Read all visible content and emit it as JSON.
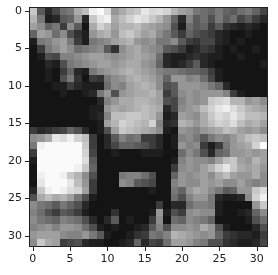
{
  "chart_data": {
    "type": "heatmap",
    "title": "",
    "xlabel": "",
    "ylabel": "",
    "colormap": "gray",
    "x_ticks": [
      0,
      5,
      10,
      15,
      20,
      25,
      30
    ],
    "y_ticks": [
      0,
      5,
      10,
      15,
      20,
      25,
      30
    ],
    "xlim": [
      -0.5,
      31.5
    ],
    "ylim": [
      31.5,
      -0.5
    ],
    "grid": false,
    "shape": [
      32,
      32
    ],
    "values": [
      [
        200,
        90,
        40,
        70,
        110,
        120,
        170,
        190,
        240,
        250,
        220,
        150,
        170,
        190,
        200,
        230,
        215,
        220,
        210,
        180,
        160,
        150,
        120,
        110,
        100,
        120,
        100,
        90,
        110,
        120,
        100,
        70
      ],
      [
        180,
        120,
        30,
        40,
        90,
        100,
        150,
        40,
        200,
        230,
        240,
        170,
        190,
        210,
        230,
        220,
        200,
        180,
        150,
        100,
        40,
        130,
        90,
        110,
        80,
        120,
        90,
        110,
        70,
        90,
        60,
        40
      ],
      [
        160,
        140,
        100,
        120,
        60,
        140,
        90,
        20,
        170,
        210,
        190,
        160,
        180,
        180,
        190,
        170,
        160,
        150,
        140,
        80,
        30,
        110,
        90,
        100,
        60,
        90,
        50,
        40,
        30,
        40,
        30,
        20
      ],
      [
        100,
        160,
        150,
        110,
        140,
        80,
        50,
        30,
        150,
        170,
        180,
        150,
        190,
        200,
        180,
        160,
        170,
        140,
        120,
        90,
        60,
        100,
        80,
        70,
        60,
        40,
        30,
        20,
        20,
        30,
        20,
        20
      ],
      [
        30,
        120,
        130,
        150,
        160,
        120,
        60,
        30,
        120,
        130,
        140,
        160,
        170,
        180,
        150,
        140,
        150,
        120,
        120,
        140,
        90,
        60,
        50,
        70,
        70,
        40,
        30,
        20,
        30,
        20,
        20,
        20
      ],
      [
        20,
        60,
        120,
        140,
        160,
        140,
        110,
        120,
        130,
        140,
        90,
        50,
        140,
        160,
        170,
        150,
        140,
        130,
        90,
        80,
        60,
        30,
        40,
        60,
        50,
        30,
        20,
        30,
        20,
        20,
        30,
        20
      ],
      [
        20,
        30,
        80,
        70,
        130,
        130,
        140,
        150,
        160,
        160,
        150,
        140,
        150,
        160,
        170,
        160,
        150,
        110,
        40,
        30,
        30,
        40,
        50,
        40,
        30,
        30,
        20,
        20,
        30,
        20,
        20,
        20
      ],
      [
        20,
        20,
        40,
        30,
        80,
        120,
        130,
        140,
        150,
        160,
        160,
        150,
        160,
        170,
        170,
        150,
        140,
        100,
        40,
        30,
        40,
        60,
        90,
        40,
        30,
        20,
        20,
        20,
        20,
        20,
        20,
        30
      ],
      [
        20,
        20,
        30,
        20,
        60,
        100,
        40,
        30,
        120,
        140,
        150,
        160,
        170,
        180,
        170,
        160,
        150,
        130,
        120,
        120,
        110,
        100,
        100,
        90,
        60,
        30,
        20,
        20,
        20,
        20,
        20,
        20
      ],
      [
        20,
        20,
        30,
        20,
        80,
        120,
        50,
        20,
        60,
        50,
        120,
        140,
        150,
        170,
        180,
        170,
        160,
        140,
        100,
        150,
        150,
        130,
        140,
        110,
        70,
        30,
        20,
        20,
        20,
        20,
        20,
        20
      ],
      [
        20,
        20,
        20,
        30,
        30,
        60,
        40,
        30,
        30,
        30,
        110,
        140,
        130,
        160,
        170,
        180,
        170,
        140,
        80,
        90,
        150,
        150,
        150,
        140,
        120,
        100,
        40,
        20,
        20,
        20,
        20,
        20
      ],
      [
        20,
        20,
        20,
        20,
        30,
        20,
        20,
        30,
        40,
        120,
        150,
        80,
        150,
        160,
        170,
        170,
        180,
        160,
        60,
        90,
        140,
        150,
        140,
        150,
        150,
        150,
        130,
        60,
        30,
        20,
        20,
        20
      ],
      [
        20,
        20,
        20,
        20,
        20,
        20,
        20,
        20,
        20,
        40,
        130,
        150,
        170,
        170,
        180,
        180,
        170,
        160,
        80,
        70,
        130,
        150,
        140,
        150,
        200,
        210,
        220,
        180,
        180,
        150,
        160,
        140
      ],
      [
        20,
        20,
        20,
        20,
        20,
        20,
        20,
        20,
        30,
        30,
        150,
        170,
        160,
        170,
        180,
        190,
        180,
        170,
        40,
        70,
        140,
        150,
        160,
        190,
        210,
        230,
        240,
        220,
        200,
        180,
        170,
        160
      ],
      [
        20,
        20,
        20,
        20,
        20,
        20,
        20,
        20,
        30,
        40,
        130,
        190,
        190,
        200,
        200,
        190,
        180,
        150,
        30,
        40,
        160,
        150,
        140,
        170,
        200,
        220,
        210,
        230,
        210,
        190,
        190,
        180
      ],
      [
        20,
        20,
        20,
        20,
        20,
        20,
        20,
        20,
        20,
        30,
        160,
        180,
        210,
        200,
        190,
        180,
        210,
        130,
        40,
        50,
        180,
        170,
        150,
        170,
        190,
        210,
        200,
        220,
        190,
        170,
        180,
        160
      ],
      [
        60,
        40,
        50,
        60,
        70,
        100,
        80,
        40,
        20,
        30,
        80,
        160,
        200,
        190,
        180,
        170,
        160,
        140,
        30,
        20,
        150,
        140,
        130,
        150,
        160,
        170,
        190,
        180,
        160,
        150,
        160,
        140
      ],
      [
        140,
        150,
        170,
        230,
        220,
        240,
        210,
        190,
        60,
        20,
        40,
        90,
        130,
        110,
        120,
        60,
        60,
        40,
        20,
        30,
        130,
        140,
        120,
        90,
        120,
        140,
        130,
        150,
        170,
        190,
        200,
        190
      ],
      [
        120,
        240,
        250,
        250,
        250,
        250,
        250,
        200,
        60,
        20,
        40,
        70,
        100,
        100,
        90,
        80,
        60,
        40,
        20,
        30,
        150,
        130,
        140,
        60,
        30,
        60,
        120,
        150,
        160,
        170,
        210,
        250
      ],
      [
        60,
        250,
        250,
        250,
        250,
        250,
        250,
        210,
        70,
        20,
        20,
        30,
        20,
        20,
        20,
        30,
        30,
        30,
        20,
        20,
        110,
        140,
        120,
        80,
        40,
        100,
        110,
        150,
        150,
        160,
        150,
        160
      ],
      [
        30,
        250,
        250,
        250,
        250,
        250,
        250,
        220,
        90,
        20,
        20,
        20,
        20,
        20,
        20,
        20,
        20,
        20,
        20,
        30,
        130,
        150,
        140,
        140,
        130,
        160,
        190,
        200,
        160,
        150,
        180,
        160
      ],
      [
        20,
        250,
        250,
        250,
        250,
        250,
        240,
        200,
        100,
        20,
        20,
        20,
        20,
        20,
        20,
        20,
        20,
        20,
        20,
        60,
        140,
        150,
        140,
        160,
        180,
        210,
        230,
        200,
        170,
        160,
        170,
        150
      ],
      [
        20,
        240,
        250,
        250,
        240,
        200,
        180,
        140,
        80,
        20,
        20,
        20,
        120,
        130,
        130,
        110,
        80,
        20,
        20,
        100,
        150,
        140,
        150,
        160,
        140,
        170,
        190,
        160,
        150,
        150,
        170,
        140
      ],
      [
        20,
        230,
        250,
        250,
        250,
        230,
        190,
        150,
        60,
        20,
        20,
        20,
        140,
        130,
        90,
        80,
        70,
        20,
        20,
        130,
        150,
        140,
        140,
        160,
        150,
        160,
        140,
        140,
        160,
        140,
        130,
        140
      ],
      [
        40,
        200,
        240,
        250,
        240,
        220,
        210,
        160,
        60,
        20,
        20,
        20,
        20,
        20,
        20,
        20,
        30,
        20,
        20,
        120,
        100,
        150,
        170,
        160,
        140,
        120,
        90,
        100,
        150,
        150,
        200,
        220
      ],
      [
        80,
        170,
        190,
        170,
        180,
        160,
        120,
        80,
        30,
        20,
        20,
        20,
        20,
        20,
        20,
        20,
        20,
        20,
        20,
        110,
        80,
        130,
        150,
        150,
        120,
        40,
        30,
        30,
        40,
        140,
        210,
        240
      ],
      [
        140,
        120,
        110,
        90,
        120,
        100,
        80,
        40,
        20,
        20,
        20,
        20,
        20,
        20,
        20,
        20,
        20,
        60,
        20,
        40,
        40,
        110,
        130,
        130,
        120,
        30,
        20,
        20,
        20,
        20,
        150,
        200
      ],
      [
        130,
        110,
        80,
        60,
        90,
        80,
        60,
        30,
        20,
        20,
        20,
        50,
        20,
        20,
        20,
        20,
        30,
        150,
        30,
        80,
        60,
        140,
        150,
        140,
        140,
        30,
        20,
        20,
        30,
        40,
        100,
        140
      ],
      [
        140,
        120,
        110,
        100,
        130,
        120,
        110,
        80,
        40,
        20,
        40,
        90,
        20,
        30,
        20,
        20,
        60,
        140,
        20,
        110,
        100,
        140,
        130,
        120,
        100,
        20,
        20,
        20,
        20,
        30,
        80,
        110
      ],
      [
        130,
        140,
        150,
        130,
        150,
        150,
        140,
        110,
        80,
        30,
        20,
        30,
        20,
        20,
        30,
        40,
        90,
        130,
        80,
        140,
        140,
        150,
        140,
        170,
        150,
        80,
        30,
        20,
        20,
        20,
        40,
        80
      ],
      [
        150,
        160,
        160,
        160,
        140,
        130,
        130,
        150,
        120,
        90,
        30,
        20,
        20,
        30,
        50,
        60,
        120,
        110,
        130,
        180,
        170,
        160,
        150,
        140,
        150,
        100,
        60,
        50,
        40,
        40,
        30,
        60
      ],
      [
        140,
        200,
        170,
        160,
        60,
        70,
        80,
        40,
        30,
        30,
        20,
        20,
        30,
        40,
        100,
        40,
        70,
        60,
        110,
        160,
        160,
        150,
        130,
        120,
        80,
        80,
        50,
        40,
        30,
        30,
        40,
        70
      ]
    ]
  }
}
